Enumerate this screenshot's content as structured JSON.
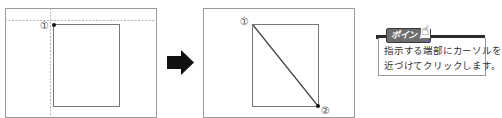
{
  "diagram": {
    "left_panel": {
      "marker_label": "①",
      "description": "Rectangle with crosshair guides at point 1"
    },
    "arrow": {
      "icon": "right-arrow-icon",
      "color": "#111111"
    },
    "right_panel": {
      "start_label": "①",
      "end_label": "②",
      "description": "Rectangle with diagonal from point 1 to point 2"
    },
    "tip": {
      "badge_label": "ポイント",
      "hand_icon": "☝",
      "line1": "指示する端部にカーソルを",
      "line2": "近づけてクリックします。"
    },
    "colors": {
      "frame": "#9a9a9a",
      "guide": "#b5b5b5",
      "line": "#555555",
      "point": "#111111",
      "badge_bg": "#6d6d6d"
    }
  }
}
